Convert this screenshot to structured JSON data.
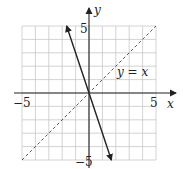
{
  "chart_data": {
    "type": "line",
    "title": "",
    "xlabel": "x",
    "ylabel": "y",
    "xlim": [
      -5,
      5
    ],
    "ylim": [
      -5,
      5
    ],
    "grid": true,
    "grid_step": 1,
    "tick_labels": {
      "x": [
        {
          "value": -5,
          "label": "−5"
        },
        {
          "value": 5,
          "label": "5"
        }
      ],
      "y": [
        {
          "value": 5,
          "label": "5"
        },
        {
          "value": -5,
          "label": "−5"
        }
      ]
    },
    "series": [
      {
        "name": "steep line (y = -3x)",
        "style": "solid",
        "arrows": "both",
        "color": "#222222",
        "x": [
          -1.67,
          1.67
        ],
        "y": [
          5,
          -5
        ]
      },
      {
        "name": "y = x",
        "style": "dashed",
        "arrows": "none",
        "color": "#444444",
        "x": [
          -5,
          5
        ],
        "y": [
          -5,
          5
        ]
      }
    ],
    "annotations": [
      {
        "text": "y = x",
        "x": 2.1,
        "y": 1.6
      }
    ]
  },
  "labels": {
    "x_axis": "x",
    "y_axis": "y",
    "x_min": "−5",
    "x_max": "5",
    "y_max": "5",
    "y_min": "−5",
    "dashed_line_label": "y = x"
  },
  "colors": {
    "grid": "#c8c8c8",
    "axis": "#222222",
    "line": "#222222",
    "dashed": "#444444"
  }
}
